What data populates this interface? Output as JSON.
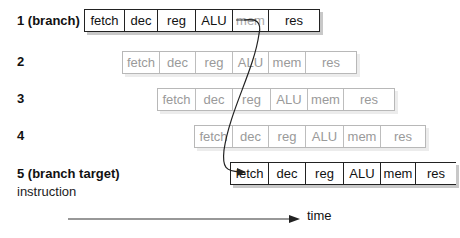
{
  "diagram": {
    "rows": [
      {
        "label": "1 (branch)",
        "stages": [
          "fetch",
          "dec",
          "reg",
          "ALU",
          "mem",
          "res"
        ],
        "faded": false
      },
      {
        "label": "2",
        "stages": [
          "fetch",
          "dec",
          "reg",
          "ALU",
          "mem",
          "res"
        ],
        "faded": true
      },
      {
        "label": "3",
        "stages": [
          "fetch",
          "dec",
          "reg",
          "ALU",
          "mem",
          "res"
        ],
        "faded": true
      },
      {
        "label": "4",
        "stages": [
          "fetch",
          "dec",
          "reg",
          "ALU",
          "mem",
          "res"
        ],
        "faded": true
      },
      {
        "label": "5 (branch target)",
        "stages": [
          "fetch",
          "dec",
          "reg",
          "ALU",
          "mem",
          "res"
        ],
        "faded": false
      }
    ],
    "row5_sublabel": "instruction",
    "time_axis_label": "time",
    "colors": {
      "line": "#222222",
      "faded": "#b8b8b8",
      "shadow": "#c8c8c8"
    }
  }
}
